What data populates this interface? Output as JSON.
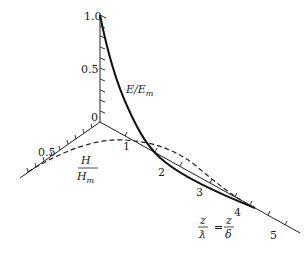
{
  "figure": {
    "type": "3d-axis-diagram",
    "axes": {
      "vertical": {
        "label": "E/E_m",
        "ticks": [
          "0",
          "0.5",
          "1.0"
        ]
      },
      "horizontal_left": {
        "label": "H/H_m",
        "ticks": [
          "0.5"
        ]
      },
      "depth": {
        "label": "z/ƛ = z/δ",
        "ticks": [
          "1",
          "2",
          "3",
          "4",
          "5"
        ]
      }
    },
    "labels": {
      "v_tick_0": "0",
      "v_tick_05": "0.5",
      "v_tick_10": "1.0",
      "h_tick_05": "0.5",
      "z_tick_1": "1",
      "z_tick_2": "2",
      "z_tick_3": "3",
      "z_tick_4": "4",
      "z_tick_5": "5",
      "e_label_main": "E/E",
      "e_label_sub": "m",
      "h_num": "H",
      "h_den_main": "H",
      "h_den_sub": "m",
      "z_num_left": "z",
      "z_den_left": "ƛ",
      "z_eq": "=",
      "z_num_right": "z",
      "z_den_right": "δ"
    },
    "curves": [
      {
        "name": "E/E_m",
        "style": "solid",
        "description": "decays from 1.0 at z=0 toward axis near z=4"
      },
      {
        "name": "H/H_m",
        "style": "dashed",
        "description": "starts at 0.5 on H axis, bulges then converges near z=4"
      }
    ]
  }
}
